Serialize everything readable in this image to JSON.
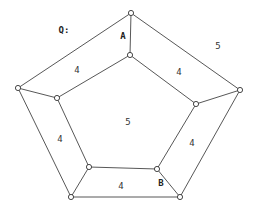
{
  "diagram": {
    "title_label": "Q:",
    "vertices": {
      "outer": [
        {
          "id": "o_top",
          "x": 131,
          "y": 13
        },
        {
          "id": "o_right",
          "x": 240,
          "y": 90
        },
        {
          "id": "o_bottom_right",
          "x": 180,
          "y": 197
        },
        {
          "id": "o_bottom_left",
          "x": 71,
          "y": 197
        },
        {
          "id": "o_left",
          "x": 18,
          "y": 88
        }
      ],
      "inner": [
        {
          "id": "i_top",
          "x": 130,
          "y": 55
        },
        {
          "id": "i_right",
          "x": 196,
          "y": 104
        },
        {
          "id": "i_bottom_right",
          "x": 157,
          "y": 169
        },
        {
          "id": "i_bottom_left",
          "x": 89,
          "y": 167
        },
        {
          "id": "i_left",
          "x": 57,
          "y": 98
        }
      ]
    },
    "labels": [
      {
        "id": "q",
        "text": "Q:",
        "x": 64,
        "y": 30,
        "bold": true
      },
      {
        "id": "A",
        "text": "A",
        "x": 123,
        "y": 36,
        "bold": true
      },
      {
        "id": "B",
        "text": "B",
        "x": 161,
        "y": 183,
        "bold": true
      },
      {
        "id": "outer_face",
        "text": "5",
        "x": 218,
        "y": 46,
        "bold": false
      },
      {
        "id": "center_face",
        "text": "5",
        "x": 128,
        "y": 122,
        "bold": false
      },
      {
        "id": "face_upper_left",
        "text": "4",
        "x": 77,
        "y": 70,
        "bold": false
      },
      {
        "id": "face_upper_right",
        "text": "4",
        "x": 179,
        "y": 72,
        "bold": false
      },
      {
        "id": "face_right",
        "text": "4",
        "x": 192,
        "y": 143,
        "bold": false
      },
      {
        "id": "face_bottom",
        "text": "4",
        "x": 121,
        "y": 186,
        "bold": false
      },
      {
        "id": "face_left",
        "text": "4",
        "x": 60,
        "y": 139,
        "bold": false
      }
    ],
    "colors": {
      "stroke": "#444444",
      "vertex_fill": "#ffffff"
    }
  }
}
